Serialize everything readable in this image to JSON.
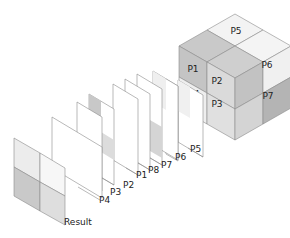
{
  "diagram": {
    "type": "exploded-cube-layers",
    "cube_labels": {
      "top": "P5",
      "left_upper": "P1",
      "front_upper": "P2",
      "right_upper": "P6",
      "left_lower": "P4",
      "front_lower": "P3",
      "right_lower": "P7"
    },
    "layers": [
      {
        "label": "P5"
      },
      {
        "label": "P6"
      },
      {
        "label": "P7"
      },
      {
        "label": "P8"
      },
      {
        "label": "P1"
      },
      {
        "label": "P2"
      },
      {
        "label": "P3"
      },
      {
        "label": "P4"
      }
    ],
    "result_label": "Result",
    "colors": {
      "light": "#f1f1f1",
      "mid": "#d6d6d6",
      "dark": "#bdbdbd",
      "darker": "#a9a9a9",
      "stroke": "#8a8a8a"
    }
  }
}
